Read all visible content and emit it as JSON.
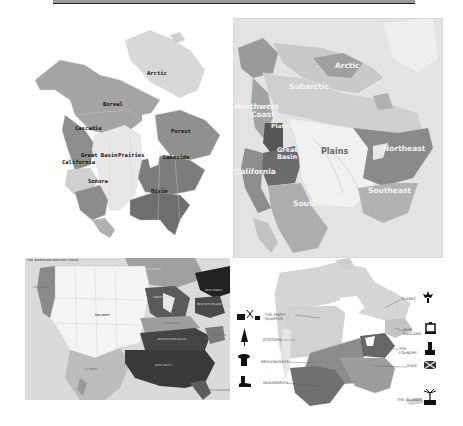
{
  "page": {
    "layout": "2x2 collage of North America maps"
  },
  "maps": [
    {
      "id": "culture-areas-map",
      "style": "grayscale map with state/province borders",
      "labels": [
        {
          "text": "Arctic",
          "x": 117,
          "y": 53
        },
        {
          "text": "Boreal",
          "x": 73,
          "y": 84
        },
        {
          "text": "Cascadia",
          "x": 45,
          "y": 108
        },
        {
          "text": "Forest",
          "x": 141,
          "y": 111
        },
        {
          "text": "Great Basin",
          "x": 51,
          "y": 135
        },
        {
          "text": "Prairies",
          "x": 88,
          "y": 135
        },
        {
          "text": "Lakeside",
          "x": 133,
          "y": 137
        },
        {
          "text": "California",
          "x": 32,
          "y": 141
        },
        {
          "text": "Sonora",
          "x": 58,
          "y": 161
        },
        {
          "text": "Dixie",
          "x": 121,
          "y": 171
        }
      ]
    },
    {
      "id": "native-culture-regions-map",
      "style": "grayscale region map",
      "labels": [
        {
          "text": "Arctic",
          "x": 102,
          "y": 47
        },
        {
          "text": "Subarctic",
          "x": 56,
          "y": 68
        },
        {
          "text": "Northwest",
          "x": 2,
          "y": 88
        },
        {
          "text": "Coast",
          "x": 18,
          "y": 96
        },
        {
          "text": "Plateau",
          "x": 38,
          "y": 108
        },
        {
          "text": "Great",
          "x": 44,
          "y": 132
        },
        {
          "text": "Basin",
          "x": 44,
          "y": 139
        },
        {
          "text": "Plains",
          "x": 88,
          "y": 133
        },
        {
          "text": "Northeast",
          "x": 150,
          "y": 130
        },
        {
          "text": "California",
          "x": 2,
          "y": 153
        },
        {
          "text": "Southeast",
          "x": 135,
          "y": 172
        },
        {
          "text": "Southwest",
          "x": 60,
          "y": 185
        }
      ]
    },
    {
      "id": "american-nations-today-map",
      "title": "THE AMERICAN NATIONS TODAY",
      "labels": [
        {
          "text": "LEFT COAST",
          "x": 8,
          "y": 30,
          "tone": "dark"
        },
        {
          "text": "FAR WEST",
          "x": 70,
          "y": 58,
          "tone": "dark"
        },
        {
          "text": "FIRST NATION",
          "x": 118,
          "y": 12,
          "tone": "light"
        },
        {
          "text": "NEW FRANCE",
          "x": 180,
          "y": 33,
          "tone": "light"
        },
        {
          "text": "YANKEEDOM",
          "x": 128,
          "y": 40,
          "tone": "light"
        },
        {
          "text": "NEW NETHERLAND",
          "x": 190,
          "y": 47,
          "tone": "light"
        },
        {
          "text": "MIDLANDS",
          "x": 140,
          "y": 66,
          "tone": "dark"
        },
        {
          "text": "GREATER APPALACHIA",
          "x": 132,
          "y": 82,
          "tone": "light"
        },
        {
          "text": "TIDEWATER",
          "x": 190,
          "y": 78,
          "tone": "dark"
        },
        {
          "text": "DEEP SOUTH",
          "x": 130,
          "y": 108,
          "tone": "light"
        },
        {
          "text": "EL NORTE",
          "x": 60,
          "y": 112,
          "tone": "dark"
        },
        {
          "text": "SPANISH CARIBBEAN",
          "x": 178,
          "y": 133,
          "tone": "dark"
        }
      ]
    },
    {
      "id": "american-nations-icons-map",
      "labels": [
        {
          "text": "QUEBEC",
          "x": 166,
          "y": 41,
          "icon": "fleur-de-lis-icon"
        },
        {
          "text": "THE EMPTY QUARTER",
          "x": 30,
          "y": 57,
          "icon": "oil-well-icon"
        },
        {
          "text": "NEW ENGLAND",
          "x": 168,
          "y": 72,
          "icon": "lantern-icon"
        },
        {
          "text": "ECOTOPIA",
          "x": 28,
          "y": 82,
          "icon": "pine-tree-icon"
        },
        {
          "text": "THE FOUNDRY",
          "x": 164,
          "y": 91,
          "icon": "factory-icon"
        },
        {
          "text": "BREADBASKET",
          "x": 26,
          "y": 104,
          "icon": "grain-silo-icon"
        },
        {
          "text": "DIXIE",
          "x": 172,
          "y": 108,
          "icon": "confederate-flag-icon"
        },
        {
          "text": "MEXAMERICA",
          "x": 28,
          "y": 125,
          "icon": "cowboy-boot-icon"
        },
        {
          "text": "THE ISLANDS",
          "x": 162,
          "y": 142,
          "icon": "palm-tree-icon"
        }
      ]
    }
  ]
}
